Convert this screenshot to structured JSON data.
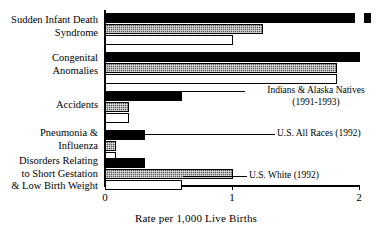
{
  "chart_data": {
    "type": "bar",
    "orientation": "horizontal",
    "title": "",
    "xlabel": "Rate per 1,000 Live Births",
    "ylabel": "",
    "xlim": [
      0,
      2
    ],
    "xticks": [
      0,
      1,
      2
    ],
    "xtick_labels": [
      "0",
      "1",
      "2"
    ],
    "grid": false,
    "legend_position": "inline-annotations",
    "categories": [
      "Sudden Infant Death\nSyndrome",
      "Congenital\nAnomalies",
      "Accidents",
      "Pneumonia &\nInfluenza",
      "Disorders Relating\nto Short Gestation\n& Low Birth Weight"
    ],
    "series": [
      {
        "name": "Indians & Alaska Natives (1991-1993)",
        "style": "black",
        "values": [
          2.05,
          2.0,
          0.6,
          0.31,
          0.31
        ],
        "clipped": [
          true,
          false,
          false,
          false,
          false
        ]
      },
      {
        "name": "U.S. All Races (1992)",
        "style": "gray-hatch",
        "values": [
          1.24,
          1.82,
          0.19,
          0.09,
          1.0
        ],
        "clipped": [
          false,
          false,
          false,
          false,
          false
        ]
      },
      {
        "name": "U.S. White (1992)",
        "style": "white",
        "values": [
          1.0,
          1.82,
          0.19,
          0.09,
          0.6
        ],
        "clipped": [
          false,
          false,
          false,
          false,
          false
        ]
      }
    ],
    "annotations": [
      {
        "text": "Indians & Alaska Natives\n(1991-1993)",
        "series": "Indians & Alaska Natives (1991-1993)"
      },
      {
        "text": "U.S. All Races (1992)",
        "series": "U.S. All Races (1992)"
      },
      {
        "text": "U.S. White (1992)",
        "series": "U.S. White (1992)"
      }
    ]
  }
}
